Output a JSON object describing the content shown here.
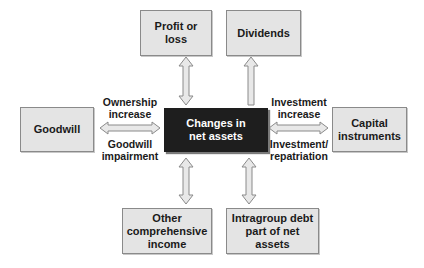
{
  "diagram": {
    "center": {
      "label": "Changes in net assets"
    },
    "nodes": [
      {
        "id": "profit-or-loss",
        "label": "Profit or loss",
        "relation": "bidirectional"
      },
      {
        "id": "dividends",
        "label": "Dividends",
        "relation": "outgoing"
      },
      {
        "id": "goodwill",
        "label": "Goodwill",
        "relation": "bidirectional"
      },
      {
        "id": "capital-instruments",
        "label": "Capital instruments",
        "relation": "bidirectional"
      },
      {
        "id": "other-comprehensive-income",
        "label": "Other comprehensive income",
        "relation": "bidirectional"
      },
      {
        "id": "intragroup-debt",
        "label": "Intragroup debt part of net assets",
        "relation": "bidirectional"
      }
    ],
    "edge_labels": {
      "goodwill_top": "Ownership increase",
      "goodwill_bottom": "Goodwill impairment",
      "capital_top": "Investment increase",
      "capital_bottom": "Investment/ repatriation"
    },
    "colors": {
      "box_fill": "#e4e4e4",
      "box_border": "#8a8a8a",
      "center_fill": "#1e1e1e",
      "center_text": "#ffffff"
    }
  }
}
